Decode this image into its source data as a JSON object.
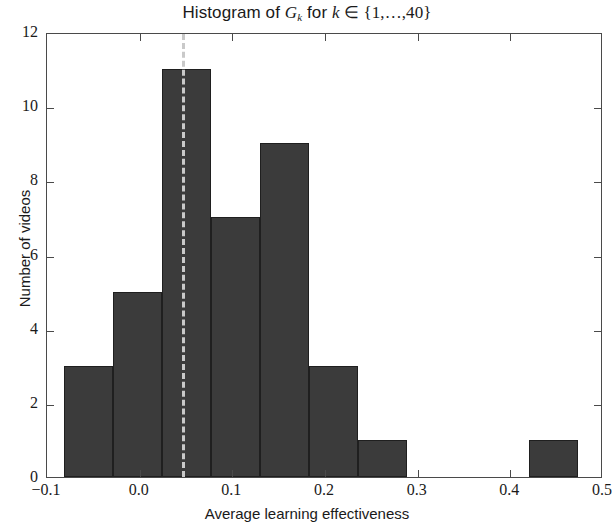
{
  "chart_data": {
    "type": "bar",
    "title_parts": {
      "prefix": "Histogram of ",
      "var": "G",
      "var_sub": "k",
      "mid": " for ",
      "index": "k",
      "member": " ∈ ",
      "set": "{1,…,40}"
    },
    "xlabel": "Average learning effectiveness",
    "ylabel": "Number of videos",
    "xlim": [
      -0.1,
      0.5
    ],
    "ylim": [
      0,
      12
    ],
    "xticks": [
      -0.1,
      0.0,
      0.1,
      0.2,
      0.3,
      0.4,
      0.5
    ],
    "xticklabels": [
      "−0.1",
      "0.0",
      "0.1",
      "0.2",
      "0.3",
      "0.4",
      "0.5"
    ],
    "yticks": [
      0,
      2,
      4,
      6,
      8,
      10,
      12
    ],
    "yticklabels": [
      "0",
      "2",
      "4",
      "6",
      "8",
      "10",
      "12"
    ],
    "grid": false,
    "legend": null,
    "bar_color": "#3b3b3b",
    "bar_edge_color": "#1f1f1f",
    "bin_edges": [
      -0.082,
      -0.029,
      0.024,
      0.077,
      0.13,
      0.183,
      0.236,
      0.289,
      0.42,
      0.473
    ],
    "bins": [
      {
        "label": "bin-1",
        "x0": -0.082,
        "x1": -0.029,
        "count": 3
      },
      {
        "label": "bin-2",
        "x0": -0.029,
        "x1": 0.024,
        "count": 5
      },
      {
        "label": "bin-3",
        "x0": 0.024,
        "x1": 0.077,
        "count": 11
      },
      {
        "label": "bin-4",
        "x0": 0.077,
        "x1": 0.13,
        "count": 7
      },
      {
        "label": "bin-5",
        "x0": 0.13,
        "x1": 0.183,
        "count": 9
      },
      {
        "label": "bin-6",
        "x0": 0.183,
        "x1": 0.236,
        "count": 3
      },
      {
        "label": "bin-7",
        "x0": 0.236,
        "x1": 0.289,
        "count": 1
      },
      {
        "label": "bin-8",
        "x0": 0.42,
        "x1": 0.473,
        "count": 1
      }
    ],
    "categories": [
      "-0.082–-0.029",
      "-0.029–0.024",
      "0.024–0.077",
      "0.077–0.130",
      "0.130–0.183",
      "0.183–0.236",
      "0.236–0.289",
      "0.420–0.473"
    ],
    "values": [
      3,
      5,
      11,
      7,
      9,
      3,
      1,
      1
    ],
    "annotations": [
      {
        "name": "mean-line",
        "type": "vline",
        "x": 0.0455,
        "style": "dashed",
        "color": "#c9c9c9"
      }
    ]
  }
}
